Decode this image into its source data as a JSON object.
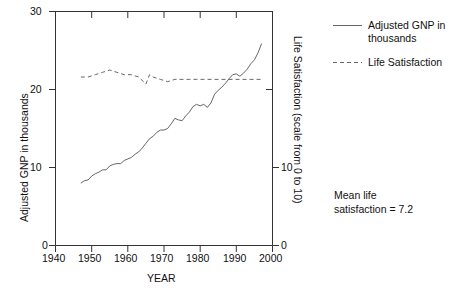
{
  "chart_data": {
    "type": "line",
    "title": "",
    "xlabel": "YEAR",
    "ylabel": "Adjusted GNP in thousands",
    "y2label": "Life Satisfaction (scale from 0 to 10)",
    "xlim": [
      1940,
      2000
    ],
    "ylim": [
      0,
      30
    ],
    "y2lim": [
      0,
      10
    ],
    "grid": false,
    "legend_position": "right",
    "xticks": [
      1940,
      1950,
      1960,
      1970,
      1980,
      1990,
      2000
    ],
    "xtick_labels": [
      "1940",
      "1950",
      "1960",
      "1970",
      "1980",
      "1990",
      "2000"
    ],
    "yticks": [
      0,
      10,
      20,
      30
    ],
    "ytick_labels": [
      "0",
      "10",
      "20",
      "30"
    ],
    "y2ticks": [
      0,
      10
    ],
    "y2tick_labels": [
      "0",
      "10"
    ],
    "annotations": [
      {
        "text_line1": "Mean life",
        "text_line2": "satisfaction = 7.2"
      }
    ],
    "series": [
      {
        "name": "Adjusted GNP in thousands",
        "axis": "left",
        "style": "solid",
        "color": "#555555",
        "x": [
          1947,
          1948,
          1949,
          1950,
          1951,
          1952,
          1953,
          1954,
          1955,
          1956,
          1957,
          1958,
          1959,
          1960,
          1961,
          1962,
          1963,
          1964,
          1965,
          1966,
          1967,
          1968,
          1969,
          1970,
          1971,
          1972,
          1973,
          1974,
          1975,
          1976,
          1977,
          1978,
          1979,
          1980,
          1981,
          1982,
          1983,
          1984,
          1985,
          1986,
          1987,
          1988,
          1989,
          1990,
          1991,
          1992,
          1993,
          1994,
          1995,
          1996,
          1997
        ],
        "values": [
          8.0,
          8.3,
          8.4,
          8.9,
          9.2,
          9.4,
          9.7,
          9.7,
          10.2,
          10.4,
          10.5,
          10.5,
          10.9,
          11.1,
          11.3,
          11.7,
          12.0,
          12.5,
          13.1,
          13.7,
          14.0,
          14.5,
          14.8,
          14.8,
          15.0,
          15.6,
          16.3,
          16.1,
          16.0,
          16.6,
          17.1,
          17.8,
          18.1,
          17.9,
          18.1,
          17.7,
          18.3,
          19.4,
          19.9,
          20.3,
          20.8,
          21.4,
          21.9,
          22.0,
          21.7,
          22.1,
          22.6,
          23.3,
          23.8,
          24.7,
          25.9
        ]
      },
      {
        "name": "Life Satisfaction",
        "axis": "right",
        "style": "dashed",
        "color": "#555555",
        "x": [
          1947,
          1949,
          1951,
          1953,
          1955,
          1957,
          1959,
          1961,
          1963,
          1965,
          1966,
          1967,
          1969,
          1971,
          1973,
          1975,
          1977,
          1979,
          1981,
          1983,
          1985,
          1987,
          1989,
          1991,
          1993,
          1995,
          1997
        ],
        "values": [
          7.2,
          7.2,
          7.3,
          7.4,
          7.5,
          7.4,
          7.3,
          7.3,
          7.2,
          6.9,
          7.3,
          7.2,
          7.1,
          7.0,
          7.1,
          7.1,
          7.1,
          7.1,
          7.1,
          7.1,
          7.1,
          7.1,
          7.1,
          7.1,
          7.1,
          7.1,
          7.1
        ]
      }
    ],
    "mean_life_satisfaction": 7.2
  },
  "axes": {
    "y_left_title": "Adjusted GNP in thousands",
    "y_right_title": "Life Satisfaction (scale from 0 to 10)",
    "x_title": "YEAR",
    "y_left_ticks": [
      "30",
      "20",
      "10",
      "0"
    ],
    "y_right_ticks": [
      "10",
      "0"
    ],
    "x_ticks": [
      "1940",
      "1950",
      "1960",
      "1970",
      "1980",
      "1990",
      "2000"
    ]
  },
  "legend": {
    "items": [
      {
        "label_line1": "Adjusted GNP in",
        "label_line2": "thousands",
        "style": "solid"
      },
      {
        "label_line1": "Life Satisfaction",
        "label_line2": "",
        "style": "dashed"
      }
    ]
  },
  "note": {
    "line1": "Mean life",
    "line2": "satisfaction = 7.2"
  },
  "colors": {
    "line": "#555555",
    "axis": "#333333",
    "text": "#111111",
    "background": "#ffffff"
  }
}
